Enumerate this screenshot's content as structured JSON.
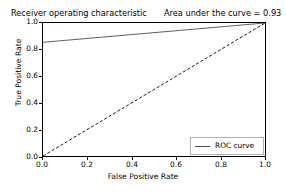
{
  "chart_data": {
    "type": "line",
    "title": "Receiver operating characteristic",
    "annotation": "Area under the curve = 0.93",
    "auc_value": "0.93",
    "xlabel": "False Positive Rate",
    "ylabel": "True Positive Rate",
    "xlim": [
      0.0,
      1.0
    ],
    "ylim": [
      0.0,
      1.0
    ],
    "grid": false,
    "legend_position": "lower right",
    "xticks": [
      "0.0",
      "0.2",
      "0.4",
      "0.6",
      "0.8",
      "1.0"
    ],
    "yticks": [
      "0.0",
      "0.2",
      "0.4",
      "0.6",
      "0.8",
      "1.0"
    ],
    "xtick_values": [
      0.0,
      0.2,
      0.4,
      0.6,
      0.8,
      1.0
    ],
    "ytick_values": [
      0.0,
      0.2,
      0.4,
      0.6,
      0.8,
      1.0
    ],
    "series": [
      {
        "name": "ROC curve",
        "style": "solid",
        "color": "#4d4d4d",
        "x": [
          0.0,
          1.0
        ],
        "values": [
          0.855,
          1.0
        ]
      },
      {
        "name": "chance-diagonal",
        "style": "dashed",
        "color": "#000000",
        "x": [
          0.0,
          1.0
        ],
        "values": [
          0.0,
          1.0
        ]
      }
    ],
    "legend": [
      {
        "label": "ROC curve",
        "color": "#4d4d4d",
        "style": "solid"
      }
    ]
  },
  "colors": {
    "background": "#ffffff",
    "axis": "#000000",
    "roc_line": "#4d4d4d",
    "diagonal_line": "#000000",
    "legend_border": "#b0b0b0"
  }
}
